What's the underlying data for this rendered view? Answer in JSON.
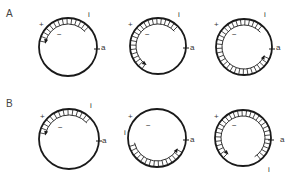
{
  "figure": {
    "rows": [
      {
        "label": "A",
        "label_pos": [
          6,
          16
        ],
        "panels": [
          {
            "cx": 68,
            "cy": 47,
            "r": 29,
            "hatch_from": 192,
            "hatch_to": 318,
            "arrow_at": "from",
            "labels": {
              "plus": "+",
              "minus": "−",
              "i": "i",
              "a": "a"
            },
            "plus_pos": [
              39,
              27
            ],
            "minus_pos": [
              57,
              37
            ],
            "i_pos": [
              88,
              17
            ],
            "a_pos": [
              101,
              50
            ]
          },
          {
            "cx": 158,
            "cy": 46,
            "r": 28,
            "hatch_from": 125,
            "hatch_to": 318,
            "arrow_at": "from",
            "labels": {
              "plus": "+",
              "minus": "−",
              "i": "i",
              "a": "a"
            },
            "plus_pos": [
              128,
              27
            ],
            "minus_pos": [
              145,
              37
            ],
            "i_pos": [
              178,
              17
            ],
            "a_pos": [
              190,
              50
            ]
          },
          {
            "cx": 244,
            "cy": 47,
            "r": 28,
            "hatch_from": 25,
            "hatch_to": 318,
            "arrow_at": "from",
            "labels": {
              "plus": "+",
              "minus": "−",
              "i": "i",
              "a": "a"
            },
            "plus_pos": [
              214,
              27
            ],
            "minus_pos": [
              232,
              37
            ],
            "i_pos": [
              264,
              17
            ],
            "a_pos": [
              276,
              50
            ]
          }
        ]
      },
      {
        "label": "B",
        "label_pos": [
          6,
          106
        ],
        "panels": [
          {
            "cx": 69,
            "cy": 139,
            "r": 30,
            "hatch_from": 192,
            "hatch_to": 318,
            "arrow_at": "from",
            "labels": {
              "plus": "+",
              "minus": "−",
              "i": "i",
              "a": "a"
            },
            "plus_pos": [
              40,
              119
            ],
            "minus_pos": [
              58,
              130
            ],
            "i_pos": [
              90,
              108
            ],
            "a_pos": [
              102,
              143
            ]
          },
          {
            "cx": 157,
            "cy": 138,
            "r": 29,
            "hatch_from": 30,
            "hatch_to": 168,
            "arrow_at": "from",
            "labels": {
              "plus": "+",
              "minus": "−",
              "i": "i",
              "a": "a"
            },
            "plus_pos": [
              128,
              119
            ],
            "minus_pos": [
              146,
              128
            ],
            "i_pos": [
              124,
              135
            ],
            "a_pos": [
              190,
              142
            ]
          },
          {
            "cx": 243,
            "cy": 138,
            "r": 28,
            "hatch_from": 135,
            "hatch_to": 418,
            "arrow_at": "from",
            "labels": {
              "plus": "+",
              "minus": "−",
              "i": "i",
              "a": "a"
            },
            "plus_pos": [
              214,
              119
            ],
            "minus_pos": [
              232,
              128
            ],
            "i_pos": [
              268,
              172
            ],
            "a_pos": [
              280,
              142
            ]
          }
        ]
      }
    ],
    "colors": {
      "stroke": "#1a1a1a",
      "text": "#333333",
      "background": "#ffffff"
    }
  }
}
